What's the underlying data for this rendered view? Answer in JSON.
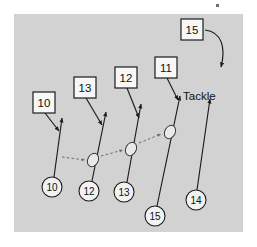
{
  "figure": {
    "name": "rugby-backline-passing-drill",
    "background_color": "#ffffff",
    "pitch_color": "#d2d2d2",
    "ink_color": "#1b1b1b",
    "pass_color": "#6f6f6f",
    "pitch": {
      "x": 14,
      "y": 14,
      "width": 229,
      "height": 218
    }
  },
  "annotations": {
    "tackle_label": "Tackle"
  },
  "player_markers": [
    {
      "id": "player-10",
      "label": "10",
      "cx": 52,
      "cy": 187,
      "r": 10
    },
    {
      "id": "player-12",
      "label": "12",
      "cx": 89,
      "cy": 191,
      "r": 10
    },
    {
      "id": "player-13",
      "label": "13",
      "cx": 124,
      "cy": 192,
      "r": 10
    },
    {
      "id": "player-15",
      "label": "15",
      "cx": 155,
      "cy": 216,
      "r": 10
    },
    {
      "id": "player-14",
      "label": "14",
      "cx": 196,
      "cy": 200,
      "r": 10
    }
  ],
  "position_labels": [
    {
      "id": "label-10",
      "label": "10",
      "x": 33,
      "y": 92,
      "w": 22,
      "h": 21
    },
    {
      "id": "label-13",
      "label": "13",
      "x": 74,
      "y": 77,
      "w": 22,
      "h": 21
    },
    {
      "id": "label-12",
      "label": "12",
      "x": 115,
      "y": 67,
      "w": 22,
      "h": 21
    },
    {
      "id": "label-11",
      "label": "11",
      "x": 155,
      "y": 57,
      "w": 22,
      "h": 21
    },
    {
      "id": "label-15",
      "label": "15",
      "x": 181,
      "y": 19,
      "w": 22,
      "h": 21
    }
  ],
  "balls": [
    {
      "id": "ball-1",
      "cx": 93,
      "cy": 160,
      "rx": 5.2,
      "ry": 7.0,
      "rotate": 28
    },
    {
      "id": "ball-2",
      "cx": 131,
      "cy": 149,
      "rx": 5.2,
      "ry": 7.0,
      "rotate": 28
    },
    {
      "id": "ball-3",
      "cx": 170,
      "cy": 132,
      "rx": 5.2,
      "ry": 7.0,
      "rotate": 28
    }
  ],
  "run_paths": [
    {
      "id": "run-10",
      "d": "M 54 177 L 62 118",
      "arrow": true
    },
    {
      "id": "run-12",
      "d": "M 92 181 L 106 112",
      "arrow": true
    },
    {
      "id": "run-13",
      "d": "M 127 182 L 141 104",
      "arrow": true
    },
    {
      "id": "run-15",
      "d": "M 157 206 L 180 96",
      "arrow": true
    },
    {
      "id": "run-14",
      "d": "M 197 190 L 210 99",
      "arrow": true
    }
  ],
  "pass_paths": [
    {
      "id": "pass-10-12",
      "d": "M 62 157 L 85 160",
      "arrow": true
    },
    {
      "id": "pass-12-13",
      "d": "M 101 156 L 123 150",
      "arrow": true
    },
    {
      "id": "pass-13-15",
      "d": "M 139 143 L 161 134",
      "arrow": true
    }
  ],
  "label_leads": [
    {
      "id": "lead-10",
      "d": "M 45 113 L 59 131",
      "arrow": true
    },
    {
      "id": "lead-13",
      "d": "M 86 98 L 102 125",
      "arrow": true
    },
    {
      "id": "lead-12",
      "d": "M 127 88 L 139 118",
      "arrow": true
    },
    {
      "id": "lead-11",
      "d": "M 167 78 L 178 100",
      "arrow": true
    }
  ],
  "curve_path": {
    "id": "curve-15",
    "d": "M 205 30 C 222 32 226 48 221 67",
    "arrow": true
  },
  "speck": {
    "x": 216,
    "y": 4,
    "w": 3,
    "h": 3
  }
}
